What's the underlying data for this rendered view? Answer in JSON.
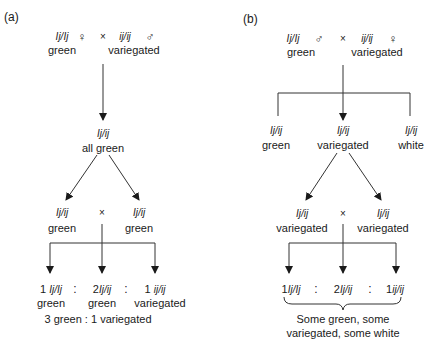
{
  "panel_a": {
    "label": "(a)",
    "parents": {
      "left_genotype": "Ij/Ij",
      "left_sex": "♀",
      "left_phenotype": "green",
      "cross": "×",
      "right_genotype": "ij/ij",
      "right_sex": "♂",
      "right_phenotype": "variegated"
    },
    "f1": {
      "genotype": "Ij/ij",
      "phenotype": "all green"
    },
    "f1_cross": {
      "left_genotype": "Ij/ij",
      "left_phenotype": "green",
      "cross": "×",
      "right_genotype": "Ij/ij",
      "right_phenotype": "green"
    },
    "f2": [
      {
        "count": "1",
        "genotype": "Ij/Ij",
        "phenotype": "green"
      },
      {
        "count": "2",
        "genotype": "Ij/ij",
        "phenotype": "green"
      },
      {
        "count": "1",
        "genotype": "ij/ij",
        "phenotype": "variegated"
      }
    ],
    "ratio_sep": ":",
    "ratio": "3 green : 1 variegated"
  },
  "panel_b": {
    "label": "(b)",
    "parents": {
      "left_genotype": "Ij/Ij",
      "left_sex": "♂",
      "left_phenotype": "green",
      "cross": "×",
      "right_genotype": "ij/ij",
      "right_sex": "♀",
      "right_phenotype": "variegated"
    },
    "f1": [
      {
        "genotype": "Ij/ij",
        "phenotype": "green"
      },
      {
        "genotype": "Ij/ij",
        "phenotype": "variegated"
      },
      {
        "genotype": "Ij/ij",
        "phenotype": "white"
      }
    ],
    "f1_cross": {
      "left_genotype": "Ij/ij",
      "left_phenotype": "variegated",
      "cross": "×",
      "right_genotype": "Ij/ij",
      "right_phenotype": "variegated"
    },
    "f2": [
      {
        "count": "1",
        "genotype": "Ij/Ij"
      },
      {
        "count": "2",
        "genotype": "Ij/ij"
      },
      {
        "count": "1",
        "genotype": "ij/ij"
      }
    ],
    "ratio_sep": ":",
    "summary_line1": "Some green, some",
    "summary_line2": "variegated, some white"
  }
}
